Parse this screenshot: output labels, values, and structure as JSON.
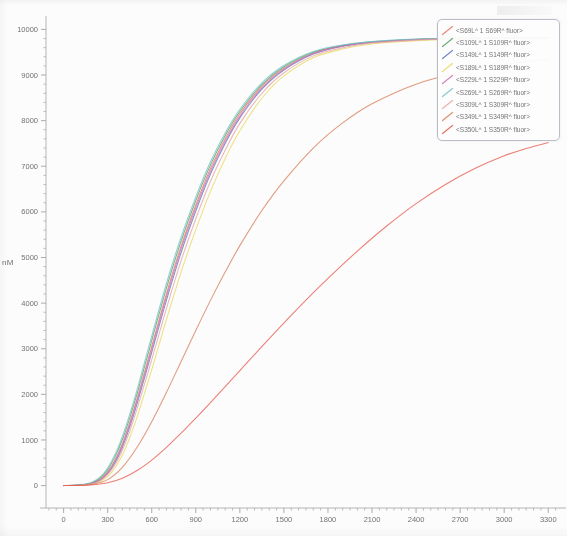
{
  "chart_data": {
    "type": "line",
    "title": "",
    "xlabel": "",
    "ylabel": "nM",
    "xlim": [
      -120,
      3380
    ],
    "ylim": [
      -250,
      10250
    ],
    "xticks": [
      0,
      300,
      600,
      900,
      1200,
      1500,
      1800,
      2100,
      2400,
      2700,
      3000,
      3300
    ],
    "yticks": [
      0,
      1000,
      2000,
      3000,
      4000,
      5000,
      6000,
      7000,
      8000,
      9000,
      10000
    ],
    "xtick_labels": [
      "0",
      "300",
      "600",
      "900",
      "1200",
      "1500",
      "1800",
      "2100",
      "2400",
      "2700",
      "3000",
      "3300"
    ],
    "ytick_labels": [
      "0",
      "1000",
      "2000",
      "3000",
      "4000",
      "5000",
      "6000",
      "7000",
      "8000",
      "9000",
      "10000"
    ],
    "minor_tick_interval_x": 50,
    "minor_tick_interval_y": 200,
    "grid": false,
    "legend_position": "upper right",
    "series": [
      {
        "name": "<S69L^ 1 S69R^ fluor>",
        "color": "#e8705f",
        "x": [
          0,
          100,
          150,
          200,
          250,
          300,
          350,
          400,
          450,
          500,
          600,
          700,
          800,
          900,
          1000,
          1100,
          1200,
          1350,
          1500,
          1700,
          1900,
          2100,
          2400,
          2700,
          3000,
          3300
        ],
        "y": [
          0,
          10,
          25,
          60,
          140,
          300,
          560,
          920,
          1380,
          1900,
          3050,
          4200,
          5250,
          6150,
          6950,
          7600,
          8150,
          8750,
          9150,
          9480,
          9640,
          9720,
          9780,
          9800,
          9810,
          9815
        ]
      },
      {
        "name": "<S109L^ 1 S109R^ fluor>",
        "color": "#4f9e62",
        "x": [
          0,
          100,
          150,
          200,
          250,
          300,
          350,
          400,
          450,
          500,
          600,
          700,
          800,
          900,
          1000,
          1100,
          1200,
          1350,
          1500,
          1700,
          1900,
          2100,
          2400,
          2700,
          3000,
          3300
        ],
        "y": [
          0,
          12,
          30,
          75,
          170,
          350,
          630,
          1010,
          1480,
          2010,
          3180,
          4330,
          5360,
          6250,
          7030,
          7670,
          8200,
          8790,
          9180,
          9500,
          9650,
          9730,
          9785,
          9805,
          9815,
          9820
        ]
      },
      {
        "name": "<S149L^ 1 S149R^ fluor>",
        "color": "#5b6fc0",
        "x": [
          0,
          100,
          150,
          200,
          250,
          300,
          350,
          400,
          450,
          500,
          600,
          700,
          800,
          900,
          1000,
          1100,
          1200,
          1350,
          1500,
          1700,
          1900,
          2100,
          2400,
          2700,
          3000,
          3300
        ],
        "y": [
          0,
          8,
          20,
          50,
          120,
          265,
          500,
          840,
          1280,
          1790,
          2920,
          4060,
          5110,
          6020,
          6830,
          7500,
          8060,
          8690,
          9110,
          9460,
          9630,
          9715,
          9775,
          9800,
          9810,
          9815
        ]
      },
      {
        "name": "<S189L^ 1 S189R^ fluor>",
        "color": "#e8d85a",
        "x": [
          0,
          100,
          150,
          200,
          250,
          300,
          350,
          400,
          450,
          500,
          600,
          700,
          800,
          900,
          1000,
          1100,
          1200,
          1350,
          1500,
          1700,
          1900,
          2100,
          2400,
          2700,
          3000,
          3300
        ],
        "y": [
          0,
          5,
          14,
          36,
          90,
          200,
          390,
          670,
          1050,
          1500,
          2540,
          3640,
          4680,
          5610,
          6450,
          7170,
          7780,
          8490,
          8980,
          9380,
          9570,
          9680,
          9750,
          9780,
          9795,
          9800
        ]
      },
      {
        "name": "<S229L^ 1 S229R^ fluor>",
        "color": "#c96fae",
        "x": [
          0,
          100,
          150,
          200,
          250,
          300,
          350,
          400,
          450,
          500,
          600,
          700,
          800,
          900,
          1000,
          1100,
          1200,
          1350,
          1500,
          1700,
          1900,
          2100,
          2400,
          2700,
          3000,
          3300
        ],
        "y": [
          0,
          9,
          23,
          56,
          132,
          285,
          535,
          890,
          1340,
          1855,
          2990,
          4140,
          5190,
          6090,
          6890,
          7550,
          8100,
          8720,
          9130,
          9470,
          9635,
          9720,
          9778,
          9800,
          9810,
          9815
        ]
      },
      {
        "name": "<S269L^ 1 S269R^ fluor>",
        "color": "#6fc0c8",
        "x": [
          0,
          100,
          150,
          200,
          250,
          300,
          350,
          400,
          450,
          500,
          600,
          700,
          800,
          900,
          1000,
          1100,
          1200,
          1350,
          1500,
          1700,
          1900,
          2100,
          2400,
          2700,
          3000,
          3300
        ],
        "y": [
          0,
          14,
          34,
          85,
          190,
          385,
          680,
          1080,
          1560,
          2100,
          3280,
          4430,
          5450,
          6330,
          7100,
          7730,
          8250,
          8830,
          9210,
          9515,
          9660,
          9735,
          9790,
          9808,
          9818,
          9822
        ]
      },
      {
        "name": "<S309L^ 1 S309R^ fluor>",
        "color": "#e8a0a0",
        "x": [
          0,
          100,
          150,
          200,
          250,
          300,
          350,
          400,
          450,
          500,
          600,
          700,
          800,
          900,
          1000,
          1100,
          1200,
          1350,
          1500,
          1700,
          1900,
          2100,
          2400,
          2700,
          3000,
          3300
        ],
        "y": [
          0,
          7,
          18,
          45,
          108,
          240,
          455,
          775,
          1190,
          1680,
          2760,
          3880,
          4930,
          5850,
          6670,
          7350,
          7940,
          8600,
          9050,
          9420,
          9600,
          9700,
          9765,
          9792,
          9805,
          9812
        ]
      },
      {
        "name": "<S349L^ 1 S349R^ fluor>",
        "color": "#d97b55",
        "x": [
          0,
          100,
          200,
          300,
          400,
          500,
          600,
          700,
          800,
          900,
          1000,
          1100,
          1200,
          1350,
          1500,
          1700,
          1900,
          2100,
          2400,
          2700,
          3000,
          3300
        ],
        "y": [
          0,
          6,
          30,
          130,
          400,
          840,
          1400,
          2040,
          2720,
          3400,
          4060,
          4680,
          5260,
          6030,
          6680,
          7400,
          7950,
          8370,
          8800,
          9060,
          9230,
          9340
        ]
      },
      {
        "name": "<S350L^ 1 S350R^ fluor>",
        "color": "#e8564a",
        "x": [
          0,
          100,
          200,
          300,
          400,
          500,
          600,
          700,
          800,
          900,
          1000,
          1200,
          1400,
          1600,
          1800,
          2000,
          2200,
          2400,
          2600,
          2800,
          3000,
          3150,
          3300
        ],
        "y": [
          0,
          4,
          18,
          60,
          160,
          330,
          560,
          840,
          1150,
          1480,
          1820,
          2520,
          3220,
          3900,
          4540,
          5140,
          5690,
          6180,
          6600,
          6950,
          7230,
          7390,
          7520
        ]
      }
    ]
  },
  "legend": {
    "entries": [
      {
        "label": "<S69L^ 1 S69R^ fluor>",
        "color": "#e8705f"
      },
      {
        "label": "<S109L^ 1 S109R^ fluor>",
        "color": "#4f9e62"
      },
      {
        "label": "<S149L^ 1 S149R^ fluor>",
        "color": "#5b6fc0"
      },
      {
        "label": "<S189L^ 1 S189R^ fluor>",
        "color": "#e8d85a"
      },
      {
        "label": "<S229L^ 1 S229R^ fluor>",
        "color": "#c96fae"
      },
      {
        "label": "<S269L^ 1 S269R^ fluor>",
        "color": "#6fc0c8"
      },
      {
        "label": "<S309L^ 1 S309R^ fluor>",
        "color": "#e8a0a0"
      },
      {
        "label": "<S349L^ 1 S349R^ fluor>",
        "color": "#d97b55"
      },
      {
        "label": "<S350L^ 1 S350R^ fluor>",
        "color": "#e8564a"
      }
    ]
  },
  "axes": {
    "y_title": "nM"
  }
}
